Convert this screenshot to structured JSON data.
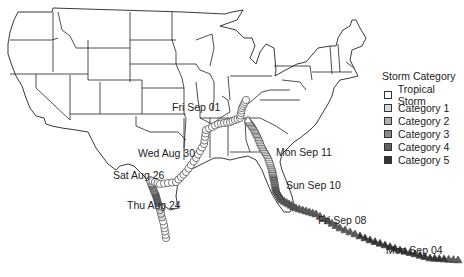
{
  "legend": {
    "title": "Storm Category",
    "items": [
      {
        "label": "Tropical Storm",
        "color": "#ffffff"
      },
      {
        "label": "Category 1",
        "color": "#d9d9d9"
      },
      {
        "label": "Category 2",
        "color": "#b0b0b0"
      },
      {
        "label": "Category 3",
        "color": "#8a8a8a"
      },
      {
        "label": "Category 4",
        "color": "#606060"
      },
      {
        "label": "Category 5",
        "color": "#333333"
      }
    ]
  },
  "track_labels": [
    {
      "id": "fri-sep-01",
      "text": "Fri Sep 01"
    },
    {
      "id": "wed-aug-30",
      "text": "Wed Aug 30"
    },
    {
      "id": "sat-aug-26",
      "text": "Sat Aug 26"
    },
    {
      "id": "thu-aug-24",
      "text": "Thu Aug 24"
    },
    {
      "id": "mon-sep-11",
      "text": "Mon Sep 11"
    },
    {
      "id": "sun-sep-10",
      "text": "Sun Sep 10"
    },
    {
      "id": "fri-sep-08",
      "text": "Fri Sep 08"
    },
    {
      "id": "mon-sep-04",
      "text": "Mon Sep 04"
    }
  ],
  "storms": [
    {
      "name": "Harvey",
      "marker": "circle",
      "start_label": "Thu Aug 24",
      "end_label": "Fri Sep 01"
    },
    {
      "name": "Irma",
      "marker": "triangle",
      "start_label": "Mon Sep 04",
      "end_label": "Mon Sep 11"
    }
  ]
}
